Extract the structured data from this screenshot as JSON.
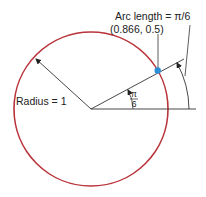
{
  "diagram": {
    "radius_label": "Radius = 1",
    "arc_label": "Arc length = π/6",
    "point_label": "(0.866, 0.5)",
    "angle_numerator": "π",
    "angle_denominator": "6",
    "angle_radians_fraction_of_pi": 0.16667,
    "point": {
      "x": 0.866,
      "y": 0.5
    },
    "radius": 1,
    "colors": {
      "circle": "#b8333a",
      "point": "#2a8fd6",
      "lines": "#333333"
    }
  }
}
